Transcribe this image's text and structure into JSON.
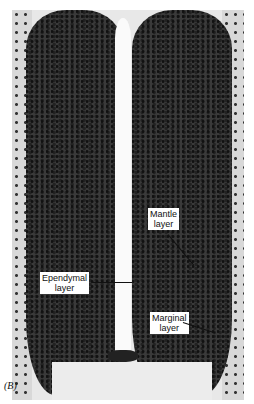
{
  "figure": {
    "panel_label": "(B)",
    "labels": [
      {
        "text_line1": "Mantle",
        "text_line2": "layer"
      },
      {
        "text_line1": "Ependymal",
        "text_line2": "layer"
      },
      {
        "text_line1": "Marginal",
        "text_line2": "layer"
      }
    ]
  }
}
